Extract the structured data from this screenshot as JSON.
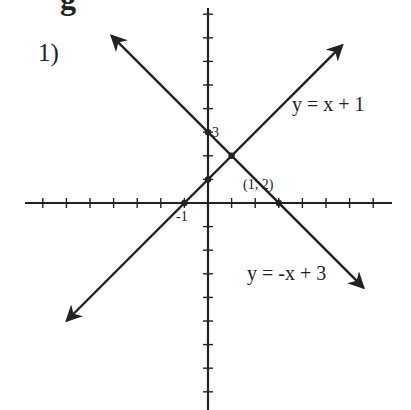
{
  "page": {
    "top_cut_glyph": "g",
    "problem_label": "1)"
  },
  "chart_data": {
    "type": "line",
    "title": "",
    "xlabel": "",
    "ylabel": "",
    "xlim": [
      -7.5,
      7.5
    ],
    "ylim": [
      -8.5,
      8.5
    ],
    "grid": false,
    "axes_ticks_every": 1,
    "series": [
      {
        "name": "y = x + 1",
        "slope": 1,
        "intercept": 1,
        "x": [
          -6,
          5.7
        ],
        "y": [
          -5,
          6.7
        ]
      },
      {
        "name": "y = -x + 3",
        "slope": -1,
        "intercept": 3,
        "x": [
          -4.1,
          6.6
        ],
        "y": [
          7.1,
          -3.6
        ]
      }
    ],
    "points": [
      {
        "label": "(1, 2)",
        "x": 1,
        "y": 2
      },
      {
        "label": "3",
        "x": 0,
        "y": 3
      },
      {
        "label": "",
        "x": 0,
        "y": 1
      },
      {
        "label": "-1",
        "x": -1,
        "y": 0
      },
      {
        "label": "",
        "x": 3,
        "y": 0
      }
    ],
    "annotations": {
      "eq1": "y = x + 1",
      "eq2": "y = -x + 3",
      "intersection": "(1, 2)",
      "y_intercept_label": "3",
      "x_intercept_label": "-1"
    },
    "colors": {
      "ink": "#222222",
      "background": "#ffffff"
    }
  }
}
